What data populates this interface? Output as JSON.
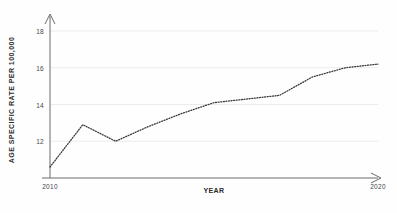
{
  "chart_data": {
    "type": "line",
    "title": "",
    "xlabel": "YEAR",
    "ylabel": "AGE SPECIFIC RATE PER 100,000",
    "x": [
      2010,
      2011,
      2012,
      2013,
      2014,
      2015,
      2016,
      2017,
      2018,
      2019,
      2020
    ],
    "values": [
      10.6,
      12.9,
      12.0,
      12.8,
      13.5,
      14.1,
      14.3,
      14.5,
      15.5,
      16.0,
      16.2
    ],
    "series": [
      {
        "name": "Age specific rate",
        "values": [
          10.6,
          12.9,
          12.0,
          12.8,
          13.5,
          14.1,
          14.3,
          14.5,
          15.5,
          16.0,
          16.2
        ]
      }
    ],
    "xlim": [
      2010,
      2020
    ],
    "ylim": [
      10.0,
      18.6
    ],
    "y_ticks": [
      12,
      14,
      16,
      18
    ],
    "y_tick_labels": [
      "12",
      "14",
      "16",
      "18"
    ],
    "x_ticks": [
      2010,
      2020
    ],
    "x_tick_labels": [
      "2010",
      "2020"
    ],
    "grid": true,
    "grid_axis": "y",
    "legend": "none",
    "line_style": "dotted",
    "line_color": "#3a3a3a",
    "grid_color": "#ebebeb",
    "axis_color": "#6b6b6b",
    "background_color": "#fefefe"
  }
}
